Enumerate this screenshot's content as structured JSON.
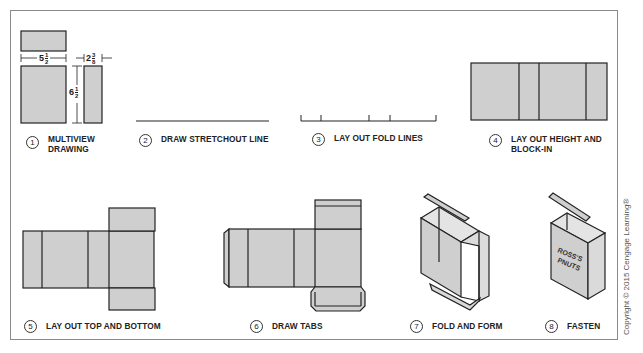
{
  "figure": {
    "colors": {
      "panel_fill": "#cfcfcf",
      "stroke": "#222222",
      "frame": "#8a8a8a",
      "background": "#ffffff"
    },
    "steps": [
      {
        "number": "1",
        "label_line1": "MULTIVIEW",
        "label_line2": "DRAWING"
      },
      {
        "number": "2",
        "label_line1": "DRAW STRETCHOUT LINE"
      },
      {
        "number": "3",
        "label_line1": "LAY OUT FOLD LINES"
      },
      {
        "number": "4",
        "label_line1": "LAY OUT HEIGHT AND",
        "label_line2": "BLOCK-IN"
      },
      {
        "number": "5",
        "label_line1": "LAY OUT TOP AND BOTTOM"
      },
      {
        "number": "6",
        "label_line1": "DRAW TABS"
      },
      {
        "number": "7",
        "label_line1": "FOLD AND FORM"
      },
      {
        "number": "8",
        "label_line1": "FASTEN"
      }
    ],
    "dimensions": {
      "width": {
        "whole": "5",
        "num": "1",
        "den": "2"
      },
      "depth": {
        "whole": "2",
        "num": "3",
        "den": "8"
      },
      "height": {
        "whole": "6",
        "num": "1",
        "den": "2"
      }
    },
    "box_print": {
      "line1": "ROSS'S",
      "line2": "PNUTS"
    },
    "copyright": "Copyright © 2015 Cengage Learning®"
  }
}
